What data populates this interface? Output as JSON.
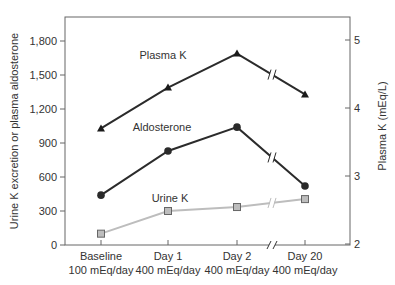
{
  "chart_data": {
    "type": "line",
    "title": "",
    "categories": [
      "Baseline",
      "Day 1",
      "Day 2",
      "Day 20"
    ],
    "category_sublabels": [
      "100 mEq/day",
      "400 mEq/day",
      "400 mEq/day",
      "400 mEq/day"
    ],
    "ylabel": "Urine K excretion or plasma aldosterone",
    "ylim": [
      0,
      2000
    ],
    "yticks": [
      0,
      300,
      600,
      900,
      1200,
      1500,
      1800
    ],
    "ytick_labels": [
      "0",
      "300",
      "600",
      "900",
      "1,200",
      "1,500",
      "1,800"
    ],
    "y2label": "Plasma K (mEq/L)",
    "y2lim": [
      2,
      5.3
    ],
    "y2ticks": [
      2,
      3,
      4,
      5
    ],
    "y2tick_labels": [
      "2",
      "3",
      "4",
      "5"
    ],
    "axis_break": "between Day 2 and Day 20",
    "grid": false,
    "series": [
      {
        "name": "Plasma K",
        "axis": "right",
        "marker": "triangle",
        "color": "#2b2b2b",
        "values": [
          3.7,
          4.3,
          4.8,
          4.2
        ]
      },
      {
        "name": "Aldosterone",
        "axis": "left",
        "marker": "circle",
        "color": "#2b2b2b",
        "values": [
          440,
          830,
          1040,
          520
        ]
      },
      {
        "name": "Urine K",
        "axis": "left",
        "marker": "square",
        "color": "#bdbdbd",
        "values": [
          100,
          300,
          335,
          405
        ]
      }
    ]
  }
}
